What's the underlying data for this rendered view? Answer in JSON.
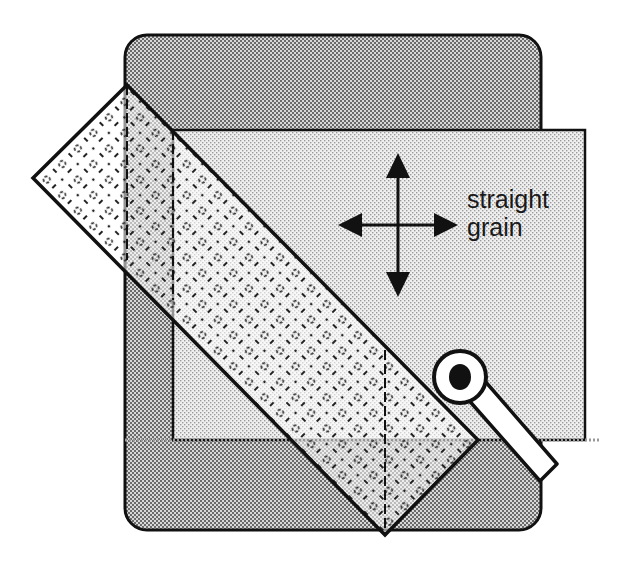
{
  "diagram": {
    "title": "",
    "label": {
      "line1": "straight",
      "line2": "grain"
    },
    "elements": {
      "cutting_mat": "cutting-mat",
      "fabric": "fabric",
      "ruler": "ruler",
      "rotary_cutter": "rotary-cutter",
      "grain_arrows": "four-way-arrow"
    },
    "colors": {
      "outline": "#111111",
      "mat_fill": "#bcbcbc",
      "fabric_fill": "#e4e4e4",
      "ruler_fill": "#f4f4f4",
      "cutter_blade": "#111111",
      "cutter_body": "#ffffff"
    }
  }
}
